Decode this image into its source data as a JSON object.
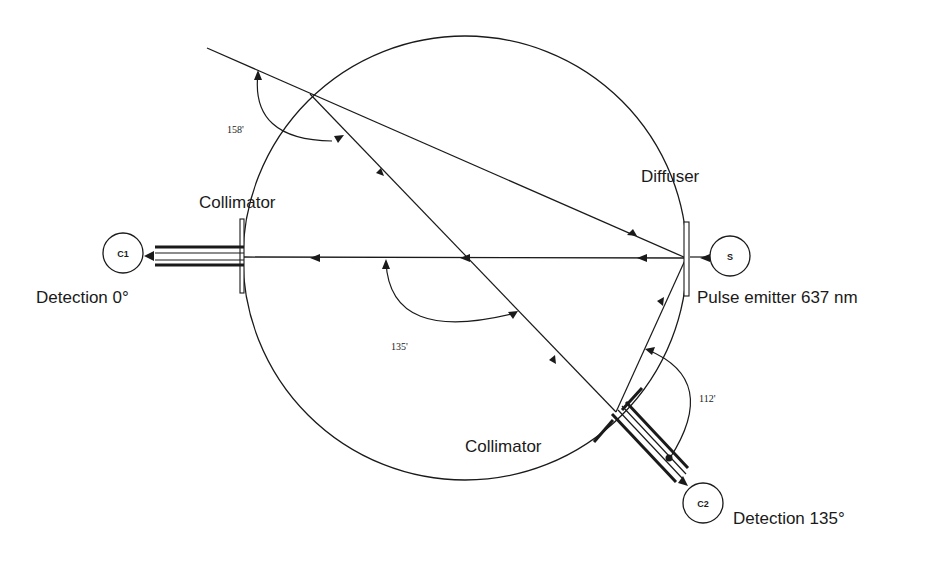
{
  "diagram": {
    "type": "optical-setup",
    "colors": {
      "ink": "#1a1a1a",
      "background": "#ffffff"
    },
    "labels": {
      "collimator_top": "Collimator",
      "collimator_bottom": "Collimator",
      "diffuser": "Diffuser",
      "detection_0": "Detection  0°",
      "detection_135": "Detection  135°",
      "pulse_emitter": "Pulse emitter 637 nm"
    },
    "angles": {
      "a158": "158'",
      "a135": "135'",
      "a112": "112'"
    },
    "nodes": {
      "c1": "C1",
      "c2": "C2",
      "s": "S"
    }
  }
}
